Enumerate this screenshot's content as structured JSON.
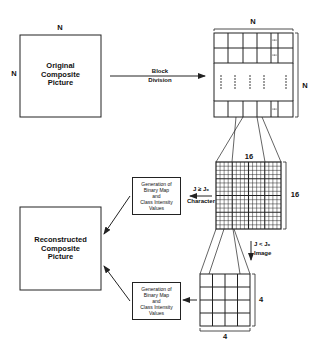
{
  "original": {
    "title_line1": "Original",
    "title_line2": "Composite",
    "title_line3": "Picture",
    "dim_top": "N",
    "dim_left": "N"
  },
  "block_division": {
    "label_line1": "Block",
    "label_line2": "Division"
  },
  "block_grid": {
    "dim_top": "N",
    "dim_right": "N"
  },
  "character_block": {
    "dim_top": "16",
    "dim_right": "16",
    "condition": "J ≥ J₀",
    "condition_label": "Character",
    "grid_size": 16
  },
  "image_block": {
    "condition": "J < J₀",
    "condition_label": "Image",
    "dim_right": "4",
    "dim_bottom": "4",
    "grid_size": 4
  },
  "generation_box_top": {
    "line1": "Generation of",
    "line2": "Binary Map",
    "line3": "and",
    "line4": "Class Intensity",
    "line5": "Values"
  },
  "generation_box_bottom": {
    "line1": "Generation of",
    "line2": "Binary Map",
    "line3": "and",
    "line4": "Class Intensity",
    "line5": "Values"
  },
  "reconstructed": {
    "title_line1": "Reconstructed",
    "title_line2": "Composite",
    "title_line3": "Picture"
  }
}
